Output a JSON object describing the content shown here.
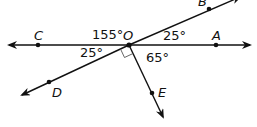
{
  "diagram": {
    "type": "angles-at-point",
    "vertex": {
      "label": "O",
      "x": 129,
      "y": 45
    },
    "points": [
      {
        "label": "C",
        "x": 38,
        "y": 45,
        "lx": 34,
        "ly": 40
      },
      {
        "label": "A",
        "x": 216,
        "y": 45,
        "lx": 212,
        "ly": 40
      },
      {
        "label": "B",
        "x": 209,
        "y": 9,
        "lx": 198,
        "ly": 6
      },
      {
        "label": "D",
        "x": 49,
        "y": 82,
        "lx": 52,
        "ly": 97
      },
      {
        "label": "E",
        "x": 152,
        "y": 93,
        "lx": 158,
        "ly": 96
      }
    ],
    "angles": [
      {
        "value": "155°",
        "x": 92,
        "y": 39
      },
      {
        "value": "25°",
        "x": 80,
        "y": 56
      },
      {
        "value": "25°",
        "x": 163,
        "y": 40
      },
      {
        "value": "65°",
        "x": 146,
        "y": 62
      }
    ],
    "right_angle_marker": true,
    "colors": {
      "ink": "#111111",
      "background": "#ffffff"
    }
  }
}
